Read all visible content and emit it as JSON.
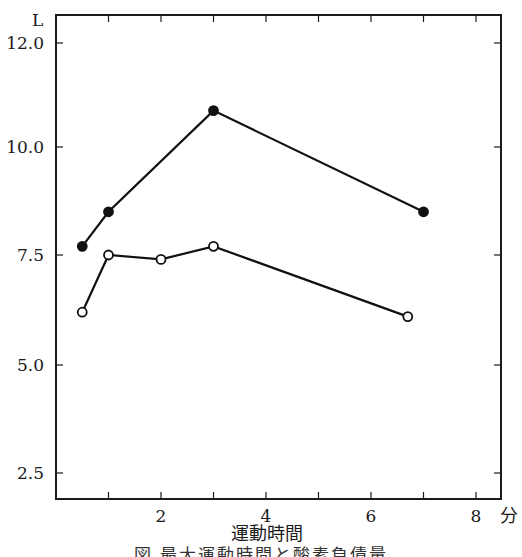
{
  "chart_data": {
    "type": "line",
    "title": "",
    "xlabel": "運動時間",
    "xunit": "分",
    "ylabel": "",
    "yunit": "L",
    "xlim": [
      0,
      8.5
    ],
    "x_ticks": [
      1,
      2,
      3,
      4,
      5,
      6,
      7,
      8
    ],
    "x_tick_labels": [
      {
        "value": 2,
        "label": "2"
      },
      {
        "value": 4,
        "label": "4"
      },
      {
        "value": 6,
        "label": "6"
      },
      {
        "value": 8,
        "label": "8"
      }
    ],
    "y_tick_labels": [
      {
        "label": "12.0",
        "py": 43
      },
      {
        "label": "10.0",
        "py": 147
      },
      {
        "label": "7.5",
        "py": 255
      },
      {
        "label": "5.0",
        "py": 365
      },
      {
        "label": "2.5",
        "py": 473
      }
    ],
    "grid": false,
    "legend": null,
    "series": [
      {
        "name": "filled-circles",
        "marker": "filled-circle",
        "x": [
          0.5,
          1,
          3,
          7
        ],
        "values": [
          7.7,
          8.5,
          10.7,
          8.5
        ]
      },
      {
        "name": "open-circles",
        "marker": "open-circle",
        "x": [
          0.5,
          1,
          2,
          3,
          6.7
        ],
        "values": [
          6.2,
          7.5,
          7.4,
          7.7,
          6.1
        ]
      }
    ]
  },
  "caption": "図 最大運動時間と酸素負債量"
}
